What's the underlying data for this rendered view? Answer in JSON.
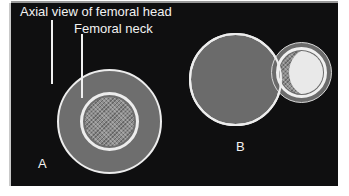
{
  "figure": {
    "background_color": "#ffffff",
    "panel_color": "#0f0f10",
    "outline_color": "#ededed",
    "bone_gray": "#6e6e6e",
    "trabecular_gray": "#8d8d8d",
    "bright_white": "#e9e9e9"
  },
  "annotations": {
    "axial_view_label": "Axial view of femoral head",
    "femoral_neck_label": "Femoral neck"
  },
  "panels": [
    {
      "letter": "A"
    },
    {
      "letter": "B"
    }
  ],
  "diagram_a": {
    "letter": "A",
    "outer_circle_name": "femoral head outline",
    "middle_ring_name": "femoral neck ring",
    "core_name": "trabecular bone core"
  },
  "diagram_b": {
    "letter": "B",
    "large_circle_name": "femoral head displaced",
    "outer_circle_name": "femoral neck outline",
    "ring_name": "femoral neck ring",
    "core_name": "trabecular bone core",
    "bright_region_name": "bright overlap region"
  }
}
